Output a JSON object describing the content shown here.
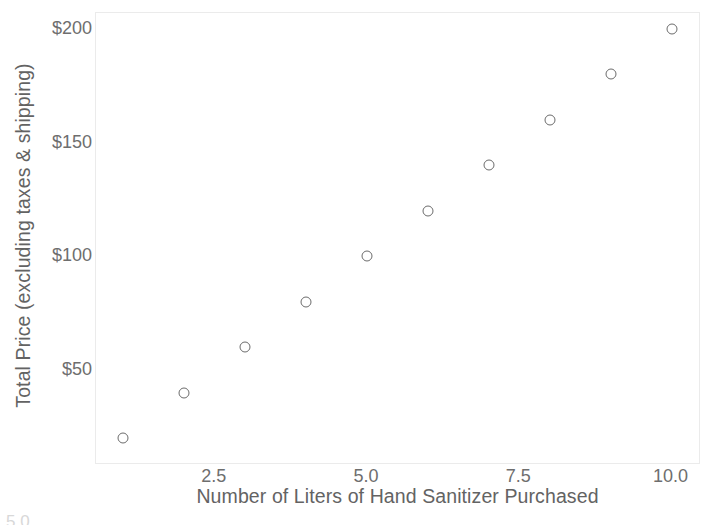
{
  "chart_data": {
    "type": "scatter",
    "title": "",
    "xlabel": "Number of Liters of Hand Sanitizer Purchased",
    "ylabel": "Total Price (excluding taxes & shipping)",
    "x": [
      1,
      2,
      3,
      4,
      5,
      6,
      7,
      8,
      9,
      10
    ],
    "values": [
      20,
      40,
      60,
      80,
      100,
      120,
      140,
      160,
      180,
      200
    ],
    "points": [
      {
        "x": 1,
        "y": 20
      },
      {
        "x": 2,
        "y": 40
      },
      {
        "x": 3,
        "y": 60
      },
      {
        "x": 4,
        "y": 80
      },
      {
        "x": 5,
        "y": 100
      },
      {
        "x": 6,
        "y": 120
      },
      {
        "x": 7,
        "y": 140
      },
      {
        "x": 8,
        "y": 160
      },
      {
        "x": 9,
        "y": 180
      },
      {
        "x": 10,
        "y": 200
      }
    ],
    "xlim": [
      0.55,
      10.45
    ],
    "ylim": [
      9,
      207
    ],
    "xticks": [
      2.5,
      5.0,
      7.5,
      10.0
    ],
    "xtick_labels": [
      "2.5",
      "5.0",
      "7.5",
      "10.0"
    ],
    "yticks": [
      50,
      100,
      150,
      200
    ],
    "ytick_labels": [
      "$50",
      "$100",
      "$150",
      "$200"
    ],
    "grid": false,
    "legend": null,
    "marker_style": "open-circle",
    "marker_color": "#6b6b6b",
    "axis_color": "#ebebeb",
    "text_color": "#6e6e6e",
    "label_color": "#636363",
    "background": "#ffffff"
  },
  "artifact": {
    "clipped_text": "5.0"
  }
}
